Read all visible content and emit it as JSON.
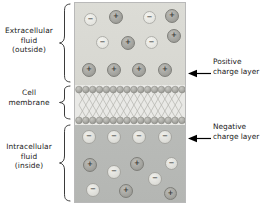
{
  "figure": {
    "labels": {
      "extracellular": "Extracellular\nfluid\n(outside)",
      "membrane": "Cell\nmembrane",
      "intracellular": "Intracellular\nfluid\n(inside)"
    },
    "callouts": {
      "positive": "Positive\ncharge layer",
      "negative": "Negative\ncharge layer"
    },
    "colors": {
      "outside_fill": "#dcdcd6",
      "membrane_fill": "#e9e9e6",
      "inside_fill": "#b9bbb8",
      "positive_ion": "#a3a39e",
      "negative_ion": "#e4e4df",
      "border": "#b9b9b9",
      "text": "#1a1a1a",
      "arrow": "#000000"
    },
    "glyphs": {
      "positive": "+",
      "negative": "−"
    }
  },
  "ions": {
    "outside": [
      {
        "charge": "negative",
        "x": 9,
        "y": 10,
        "d": 13
      },
      {
        "charge": "positive",
        "x": 34,
        "y": 7,
        "d": 14
      },
      {
        "charge": "negative",
        "x": 68,
        "y": 8,
        "d": 13
      },
      {
        "charge": "positive",
        "x": 90,
        "y": 6,
        "d": 14
      },
      {
        "charge": "negative",
        "x": 21,
        "y": 33,
        "d": 13
      },
      {
        "charge": "positive",
        "x": 46,
        "y": 33,
        "d": 14
      },
      {
        "charge": "negative",
        "x": 70,
        "y": 33,
        "d": 13
      },
      {
        "charge": "positive",
        "x": 92,
        "y": 26,
        "d": 14
      },
      {
        "charge": "positive",
        "x": 7,
        "y": 60,
        "d": 14
      },
      {
        "charge": "positive",
        "x": 32,
        "y": 60,
        "d": 14
      },
      {
        "charge": "positive",
        "x": 57,
        "y": 60,
        "d": 14
      },
      {
        "charge": "positive",
        "x": 83,
        "y": 60,
        "d": 14
      }
    ],
    "inside": [
      {
        "charge": "negative",
        "x": 7,
        "y": 5,
        "d": 14
      },
      {
        "charge": "negative",
        "x": 32,
        "y": 5,
        "d": 14
      },
      {
        "charge": "negative",
        "x": 57,
        "y": 5,
        "d": 14
      },
      {
        "charge": "negative",
        "x": 83,
        "y": 5,
        "d": 14
      },
      {
        "charge": "positive",
        "x": 8,
        "y": 33,
        "d": 14
      },
      {
        "charge": "negative",
        "x": 32,
        "y": 40,
        "d": 14
      },
      {
        "charge": "positive",
        "x": 55,
        "y": 32,
        "d": 14
      },
      {
        "charge": "negative",
        "x": 90,
        "y": 32,
        "d": 13
      },
      {
        "charge": "negative",
        "x": 73,
        "y": 47,
        "d": 14
      },
      {
        "charge": "negative",
        "x": 11,
        "y": 58,
        "d": 14
      },
      {
        "charge": "positive",
        "x": 44,
        "y": 59,
        "d": 14
      },
      {
        "charge": "positive",
        "x": 89,
        "y": 62,
        "d": 13
      }
    ]
  },
  "membrane": {
    "head_count": 16,
    "head_radius": 3.4,
    "tail_rows": 2,
    "description": "phospholipid bilayer: two rows of round head groups with crossing hydrocarbon tails"
  }
}
